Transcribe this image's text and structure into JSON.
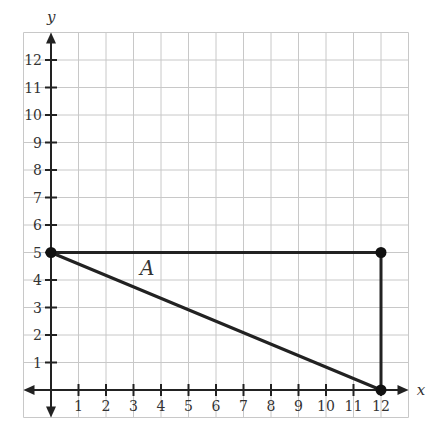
{
  "chart_data": {
    "type": "diagram",
    "title": "",
    "xlabel": "x",
    "ylabel": "y",
    "xlim": [
      -1,
      13
    ],
    "ylim": [
      -1,
      13
    ],
    "grid": true,
    "x_ticks": [
      "1",
      "2",
      "3",
      "4",
      "5",
      "6",
      "7",
      "8",
      "9",
      "10",
      "11",
      "12"
    ],
    "y_ticks": [
      "1",
      "2",
      "3",
      "4",
      "5",
      "6",
      "7",
      "8",
      "9",
      "10",
      "11",
      "12"
    ],
    "shape": {
      "label": "A",
      "type": "triangle",
      "vertices": [
        [
          0,
          5
        ],
        [
          12,
          5
        ],
        [
          12,
          0
        ]
      ],
      "label_position": [
        3.5,
        4.2
      ]
    }
  },
  "axes": {
    "x_label": "x",
    "y_label": "y"
  },
  "shape_label": "A"
}
